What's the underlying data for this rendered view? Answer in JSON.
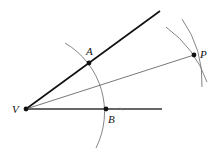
{
  "diagram": {
    "type": "angle-bisector-construction",
    "points": {
      "V": {
        "label": "V",
        "x": 26,
        "y": 109
      },
      "A": {
        "label": "A",
        "x": 89,
        "y": 63
      },
      "B": {
        "label": "B",
        "x": 106,
        "y": 109
      },
      "P": {
        "label": "P",
        "x": 194,
        "y": 55
      }
    },
    "rays": [
      {
        "name": "upper-ray",
        "from": "V",
        "to": [
          160,
          11
        ]
      },
      {
        "name": "lower-ray",
        "from": "V",
        "to": [
          162,
          109
        ]
      },
      {
        "name": "bisector",
        "from": "V",
        "to": "P"
      }
    ],
    "arcs": [
      {
        "name": "arc-centered-V",
        "center": "V",
        "radius": 80
      },
      {
        "name": "arc-centered-A",
        "center": "A"
      },
      {
        "name": "arc-centered-B",
        "center": "B"
      }
    ],
    "colors": {
      "heavy": "#111111",
      "light": "#555555",
      "arc": "#777777"
    }
  }
}
